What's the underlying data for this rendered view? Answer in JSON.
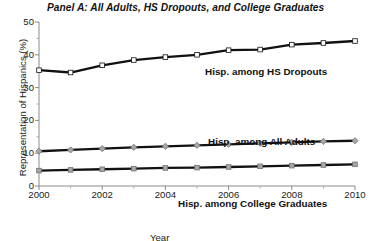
{
  "chart_data": {
    "type": "line",
    "title": "Panel A: All Adults, HS Dropouts, and College Graduates",
    "xlabel": "Year",
    "ylabel": "Representation of Hispanics (%)",
    "xlim": [
      2000,
      2010
    ],
    "ylim": [
      0,
      50
    ],
    "grid": false,
    "legend_position": "inline-annotations",
    "x": [
      2000,
      2001,
      2002,
      2003,
      2004,
      2005,
      2006,
      2007,
      2008,
      2009,
      2010
    ],
    "xticks": [
      2000,
      2002,
      2004,
      2006,
      2008,
      2010
    ],
    "xtick_labels": [
      "2000",
      "2002",
      "2004",
      "2006",
      "2008",
      "2010"
    ],
    "yticks": [
      0,
      10,
      20,
      30,
      40,
      50
    ],
    "ytick_labels": [
      "0",
      "10",
      "20",
      "30",
      "40",
      "50"
    ],
    "minor_xticks": [
      2001,
      2003,
      2005,
      2007,
      2009
    ],
    "minor_yticks": [
      5,
      15,
      25,
      35,
      45
    ],
    "series": [
      {
        "name": "Hisp. among HS Dropouts",
        "annotation": "Hisp. among HS Dropouts",
        "color": "#111111",
        "marker": "square",
        "marker_color": "#ffffff",
        "marker_edge": "#111111",
        "values": [
          35.3,
          34.6,
          36.8,
          38.4,
          39.3,
          40.0,
          41.4,
          41.6,
          43.1,
          43.6,
          44.2
        ]
      },
      {
        "name": "Hisp. among All Adults",
        "annotation": "Hisp. among All Adults",
        "color": "#111111",
        "marker": "diamond",
        "marker_color": "#a8a8a8",
        "marker_edge": "#6e6e6e",
        "values": [
          10.6,
          11.0,
          11.4,
          11.8,
          12.1,
          12.4,
          12.7,
          13.0,
          13.3,
          13.6,
          13.8
        ]
      },
      {
        "name": "Hisp. among College Graduates",
        "annotation": "Hisp. among College Graduates",
        "color": "#111111",
        "marker": "square",
        "marker_color": "#a8a8a8",
        "marker_edge": "#6e6e6e",
        "values": [
          4.7,
          4.9,
          5.1,
          5.3,
          5.5,
          5.6,
          5.8,
          6.0,
          6.2,
          6.4,
          6.6
        ]
      }
    ]
  }
}
